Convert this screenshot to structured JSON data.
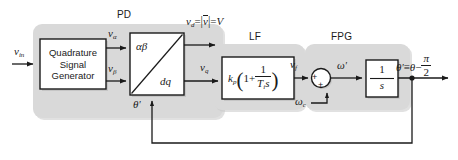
{
  "figure": {
    "type": "control-block-diagram"
  },
  "groups": [
    {
      "id": "pd",
      "caption": "PD",
      "x": 33,
      "y": 24,
      "w": 190,
      "h": 94
    },
    {
      "id": "lf",
      "caption": "LF",
      "x": 213,
      "y": 44,
      "w": 92,
      "h": 66
    },
    {
      "id": "fpg",
      "caption": "FPG",
      "x": 305,
      "y": 44,
      "w": 105,
      "h": 66
    }
  ],
  "group_captions": {
    "pd": "PD",
    "lf": "LF",
    "fpg": "FPG"
  },
  "blocks": {
    "qsg": {
      "line1": "Quadrature",
      "line2": "Signal",
      "line3": "Generator"
    },
    "transform": {
      "top_left": "αβ",
      "bottom_right": "dq"
    },
    "loop_filter": {
      "gain": "k",
      "gain_sub": "p",
      "one": "1",
      "plus": "+",
      "frac_num": "1",
      "frac_den_T": "T",
      "frac_den_sub": "i",
      "frac_den_s": "s"
    },
    "integrator": {
      "num": "1",
      "den": "s"
    },
    "summing_junction": {
      "sign_left": "+",
      "sign_bottom": "+"
    }
  },
  "signals": {
    "v_in": {
      "base": "v",
      "sub": "in"
    },
    "v_alpha": {
      "base": "v",
      "sub": "α"
    },
    "v_beta": {
      "base": "v",
      "sub": "β"
    },
    "v_d_eq": {
      "base": "v",
      "sub": "d",
      "eq1": "=",
      "vec": "v",
      "eq2": "=",
      "mag": "V"
    },
    "v_q": {
      "base": "v",
      "sub": "q"
    },
    "v_f": {
      "base": "v",
      "sub": "f"
    },
    "omega_c": {
      "base": "ω",
      "sub": "c"
    },
    "omega_prime": {
      "base": "ω",
      "prime": "′"
    },
    "theta_prime_fb": {
      "base": "θ",
      "prime": "′"
    },
    "theta_out": {
      "base": "θ",
      "prime": "′",
      "equiv": "≡",
      "theta": "θ",
      "minus": "−",
      "pi": "π",
      "two": "2"
    }
  },
  "colors": {
    "stroke": "#1a1a1a",
    "group_fill": "#d9d9d9",
    "block_fill": "#ffffff",
    "background": "#ffffff",
    "shadow": "#b3b3b3"
  }
}
